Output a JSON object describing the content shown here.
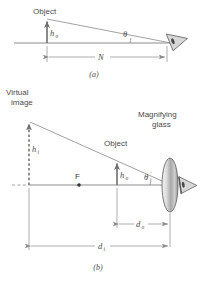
{
  "figure": {
    "panels": [
      {
        "id": "a",
        "caption": "(a)",
        "description": "Object viewed by unaided eye at near point",
        "labels": {
          "object": "Object",
          "height_symbol": "h",
          "height_subscript": "o",
          "angle": "θ",
          "distance_symbol": "N"
        }
      },
      {
        "id": "b",
        "caption": "(b)",
        "description": "Object viewed through a magnifying glass forming a virtual image",
        "labels": {
          "virtual_image_line1": "Virtual",
          "virtual_image_line2": "image",
          "image_height_symbol": "h",
          "image_height_subscript": "i",
          "focal_point": "F",
          "object": "Object",
          "object_height_symbol": "h",
          "object_height_subscript": "o",
          "angle": "θ",
          "angle_prime": "′",
          "magnifier_line1": "Magnifying",
          "magnifier_line2": "glass",
          "object_distance_symbol": "d",
          "object_distance_subscript": "o",
          "image_distance_symbol": "d",
          "image_distance_subscript": "i"
        }
      }
    ],
    "colors": {
      "background": "#ffffff",
      "line": "#808080",
      "text": "#4a4a4a",
      "arrow": "#6e6e6e",
      "lens_fill_light": "#e8e8e8",
      "lens_fill_dark": "#9a9a9a",
      "eye_fill": "#d8d8d8"
    }
  }
}
